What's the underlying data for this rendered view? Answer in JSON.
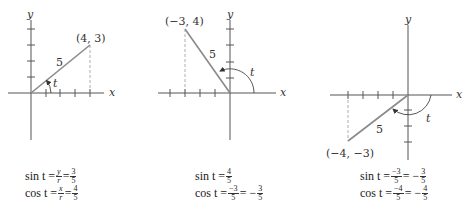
{
  "diagrams": [
    {
      "point_label": "(4, 3)",
      "hyp_label": "5",
      "angle_label": "t",
      "x_axis_label": "x",
      "y_axis_label": "y",
      "sin": {
        "lhs": "sin t =",
        "f1_num": "y",
        "f1_den": "r",
        "eq": "=",
        "f2_num": "3",
        "f2_den": "5"
      },
      "cos": {
        "lhs": "cos t =",
        "f1_num": "x",
        "f1_den": "r",
        "eq": "=",
        "f2_num": "4",
        "f2_den": "5"
      }
    },
    {
      "point_label": "(−3, 4)",
      "hyp_label": "5",
      "angle_label": "t",
      "x_axis_label": "x",
      "y_axis_label": "y",
      "sin": {
        "lhs": "sin t =",
        "f1_num": "4",
        "f1_den": "5"
      },
      "cos": {
        "lhs": "cos t =",
        "f1_num": "−3",
        "f1_den": "5",
        "eq": "= −",
        "f2_num": "3",
        "f2_den": "5"
      }
    },
    {
      "point_label": "(−4, −3)",
      "hyp_label": "5",
      "angle_label": "t",
      "x_axis_label": "x",
      "y_axis_label": "y",
      "sin": {
        "lhs": "sin t =",
        "f1_num": "−3",
        "f1_den": "5",
        "eq": "= −",
        "f2_num": "3",
        "f2_den": "5"
      },
      "cos": {
        "lhs": "cos t =",
        "f1_num": "−4",
        "f1_den": "5",
        "eq": "= −",
        "f2_num": "4",
        "f2_den": "5"
      }
    }
  ]
}
